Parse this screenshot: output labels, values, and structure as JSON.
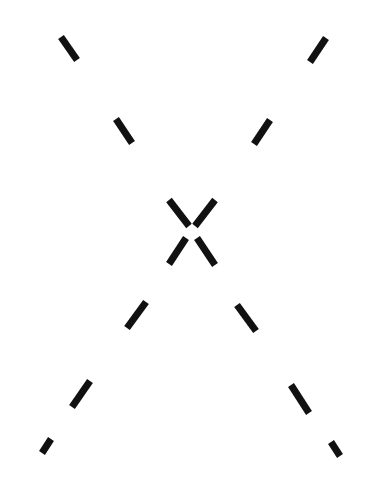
{
  "figure": {
    "width": 372,
    "height": 478,
    "background": "#ffffff",
    "stroke_color": "#111111",
    "stroke_width": 7
  },
  "segments": [
    {
      "id": "upper-left-outer",
      "x1": 61,
      "y1": 37,
      "x2": 77,
      "y2": 60
    },
    {
      "id": "upper-left-inner",
      "x1": 116,
      "y1": 119,
      "x2": 132,
      "y2": 143
    },
    {
      "id": "upper-right-outer",
      "x1": 326,
      "y1": 38,
      "x2": 310,
      "y2": 62
    },
    {
      "id": "upper-right-inner",
      "x1": 270,
      "y1": 120,
      "x2": 254,
      "y2": 144
    },
    {
      "id": "center-top-left",
      "x1": 169,
      "y1": 200,
      "x2": 189,
      "y2": 226
    },
    {
      "id": "center-top-right",
      "x1": 215,
      "y1": 200,
      "x2": 195,
      "y2": 226
    },
    {
      "id": "center-bottom-left",
      "x1": 186,
      "y1": 238,
      "x2": 169,
      "y2": 264
    },
    {
      "id": "center-bottom-right",
      "x1": 197,
      "y1": 238,
      "x2": 215,
      "y2": 265
    },
    {
      "id": "lower-left-inner",
      "x1": 146,
      "y1": 302,
      "x2": 127,
      "y2": 328
    },
    {
      "id": "lower-right-inner",
      "x1": 237,
      "y1": 305,
      "x2": 256,
      "y2": 331
    },
    {
      "id": "lower-left-mid",
      "x1": 90,
      "y1": 381,
      "x2": 72,
      "y2": 407
    },
    {
      "id": "lower-right-mid",
      "x1": 291,
      "y1": 385,
      "x2": 309,
      "y2": 413
    },
    {
      "id": "lower-left-outer",
      "x1": 51,
      "y1": 439,
      "x2": 42,
      "y2": 453
    },
    {
      "id": "lower-right-outer",
      "x1": 331,
      "y1": 442,
      "x2": 340,
      "y2": 456
    }
  ]
}
